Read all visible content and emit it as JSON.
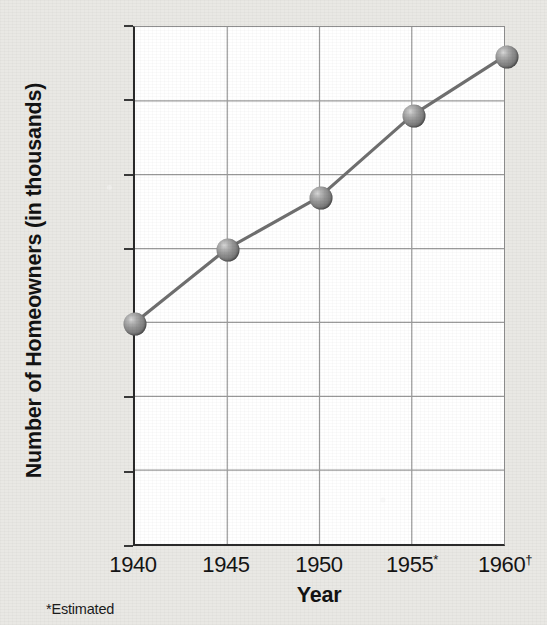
{
  "chart_data": {
    "type": "line",
    "title": "",
    "xlabel": "Year",
    "ylabel": "Number of Homeowners (in thousands)",
    "categories": [
      "1940",
      "1945",
      "1950",
      "1955*",
      "1960†"
    ],
    "x_values": [
      1940,
      1945,
      1950,
      1955,
      1960
    ],
    "values": [
      15000,
      20000,
      23500,
      29000,
      33000
    ],
    "series": [
      {
        "name": "Number of Homeowners",
        "values": [
          15000,
          20000,
          23500,
          29000,
          33000
        ]
      }
    ],
    "y_ticks": [
      "0",
      "5,000",
      "10,000",
      "15,000",
      "20,000",
      "25,000",
      "30,000",
      "35,000"
    ],
    "y_tick_values": [
      0,
      5000,
      10000,
      15000,
      20000,
      25000,
      30000,
      35000
    ],
    "ylim": [
      0,
      35000
    ],
    "grid": true,
    "legend": "none",
    "marker": "sphere",
    "footnote": "*Estimated",
    "colors": {
      "line": "#6f6f6f",
      "marker": "#8a8a8a",
      "grid": "#9a9a9a",
      "axis": "#2a2a2a",
      "plot_background": "#ffffff",
      "page_background": "#e9e8e4",
      "text": "#131313"
    }
  }
}
